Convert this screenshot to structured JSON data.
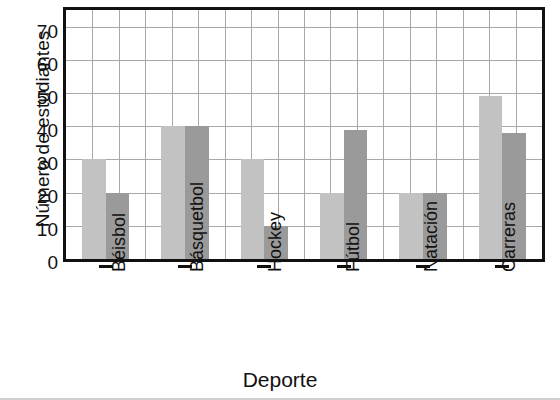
{
  "chart_data": {
    "type": "bar",
    "title": "",
    "subtitle": "",
    "xlabel": "Deporte",
    "ylabel": "Número de estudiantes",
    "categories": [
      "Béisbol",
      "Básquetbol",
      "Hockey",
      "Fútbol",
      "Natación",
      "Carreras"
    ],
    "series": [
      {
        "name": "serie-1",
        "color": "#c2c2c2",
        "values": [
          30,
          40,
          30,
          20,
          20,
          49
        ]
      },
      {
        "name": "serie-2",
        "color": "#9a9a9a",
        "values": [
          20,
          40,
          10,
          39,
          20,
          38
        ]
      }
    ],
    "ylim": [
      0,
      75
    ],
    "yticks": [
      0,
      10,
      20,
      30,
      40,
      50,
      60,
      70
    ],
    "ytick_labels": [
      "0",
      "10",
      "20",
      "30",
      "40",
      "50",
      "60",
      "70"
    ],
    "grid": true,
    "grid_color": "#a8a8a8",
    "legend": "none",
    "axis_color": "#111111",
    "background": "#ffffff"
  }
}
